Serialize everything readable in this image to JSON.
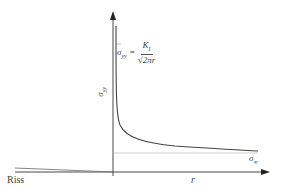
{
  "diagram": {
    "labels": {
      "crack": "Riss",
      "x_axis": "r",
      "y_axis": "σ",
      "y_axis_sub": "yy",
      "far_field": "σ",
      "far_field_sub": "∞"
    },
    "formula": {
      "lhs": "σ",
      "lhs_sub": "yy",
      "equals": "=",
      "numerator": "K",
      "numerator_sub": "I",
      "denominator": "√2πr"
    },
    "colors": {
      "axis": "#333333",
      "curve": "#444444",
      "asymptote": "#aaaaaa",
      "crack": "#777777"
    }
  }
}
